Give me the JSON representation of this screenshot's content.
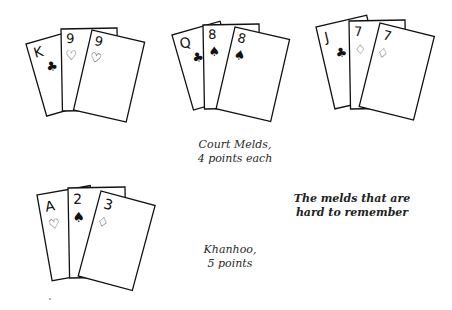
{
  "melds": [
    {
      "name": "court-meld-king-nines",
      "cards": [
        {
          "rank": "K",
          "suit": "club"
        },
        {
          "rank": "9",
          "suit": "heart"
        },
        {
          "rank": "9",
          "suit": "heart"
        }
      ]
    },
    {
      "name": "court-meld-queen-eights",
      "cards": [
        {
          "rank": "Q",
          "suit": "club"
        },
        {
          "rank": "8",
          "suit": "spade"
        },
        {
          "rank": "8",
          "suit": "spade"
        }
      ]
    },
    {
      "name": "court-meld-jack-sevens",
      "cards": [
        {
          "rank": "J",
          "suit": "club"
        },
        {
          "rank": "7",
          "suit": "diamond"
        },
        {
          "rank": "7",
          "suit": "diamond"
        }
      ]
    },
    {
      "name": "khanhoo-meld",
      "cards": [
        {
          "rank": "A",
          "suit": "heart"
        },
        {
          "rank": "2",
          "suit": "spade"
        },
        {
          "rank": "3",
          "suit": "diamond"
        }
      ]
    }
  ],
  "captions": {
    "court_line1": "Court Melds,",
    "court_line2": "4 points each",
    "khanhoo_line1": "Khanhoo,",
    "khanhoo_line2": "5 points",
    "title_line1": "The melds that are",
    "title_line2": "hard to remember"
  },
  "suit_glyphs": {
    "club": "♣",
    "heart": "♡",
    "spade": "♠",
    "diamond": "♢"
  }
}
